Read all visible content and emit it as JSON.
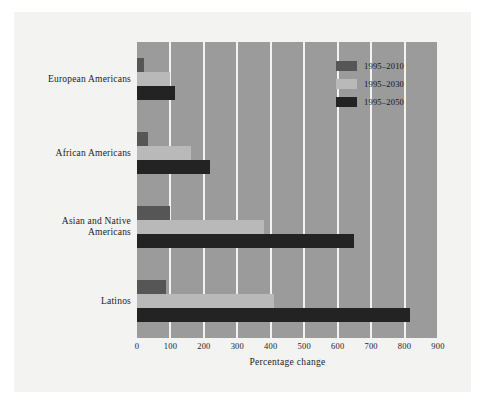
{
  "chart_data": {
    "type": "bar",
    "orientation": "horizontal",
    "title": "",
    "xlabel": "Percentage change",
    "ylabel": "",
    "xlim": [
      0,
      900
    ],
    "xticks": [
      0,
      100,
      200,
      300,
      400,
      500,
      600,
      700,
      800,
      900
    ],
    "xtick_labels": [
      "0",
      "100",
      "200",
      "300",
      "400",
      "500",
      "600",
      "700",
      "800",
      "900"
    ],
    "grid": "vertical-white",
    "legend_position": "top-right",
    "categories": [
      "European Americans",
      "African Americans",
      "Asian and Native Americans",
      "Latinos"
    ],
    "category_label_lines": [
      [
        "European Americans"
      ],
      [
        "African Americans"
      ],
      [
        "Asian and Native",
        "Americans"
      ],
      [
        "Latinos"
      ]
    ],
    "series": [
      {
        "name": "1995–2010",
        "color": "#565656",
        "values": [
          20,
          32,
          100,
          88
        ]
      },
      {
        "name": "1995–2030",
        "color": "#b9b9b9",
        "values": [
          100,
          160,
          380,
          410
        ]
      },
      {
        "name": "1995–2050",
        "color": "#232323",
        "values": [
          113,
          217,
          650,
          815
        ]
      }
    ]
  },
  "legend": {
    "entries": [
      {
        "label": "1995–2010",
        "color": "#565656"
      },
      {
        "label": "1995–2030",
        "color": "#b9b9b9"
      },
      {
        "label": "1995–2050",
        "color": "#232323"
      }
    ]
  },
  "colors": {
    "plot_background": "#9b9b9b",
    "page_background": "#ffffff",
    "panel_background": "#f3f3f1",
    "gridline": "#f2f2f2",
    "text": "#1c1c1c"
  }
}
